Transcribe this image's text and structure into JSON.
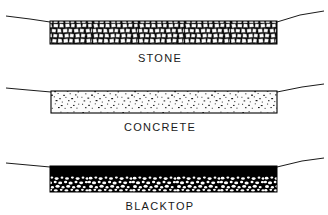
{
  "figure": {
    "background_color": "#ffffff",
    "ink_color": "#000000",
    "width": 328,
    "height": 215
  },
  "sections": [
    {
      "id": "stone",
      "label": "STONE",
      "fill_type": "crushed-stone-aggregate",
      "description": "Packed irregular light-toned crushed stones with dark mortar gaps",
      "band": {
        "x": 50,
        "y": 21,
        "width": 227,
        "height": 23
      },
      "label_position": {
        "x": 160,
        "y": 59
      },
      "ground_line": {
        "left": [
          [
            6,
            16
          ],
          [
            30,
            19
          ],
          [
            50,
            22
          ]
        ],
        "right": [
          [
            277,
            22
          ],
          [
            300,
            15
          ],
          [
            324,
            11
          ]
        ]
      },
      "colors": {
        "stone": "#ffffff",
        "mortar": "#111111",
        "outline": "#000000"
      }
    },
    {
      "id": "concrete",
      "label": "CONCRETE",
      "fill_type": "speckled-concrete",
      "description": "Light concrete slab with scattered fine dark aggregate speckles and thin black outline",
      "band": {
        "x": 51,
        "y": 91,
        "width": 226,
        "height": 22
      },
      "label_position": {
        "x": 160,
        "y": 128
      },
      "ground_line": {
        "left": [
          [
            6,
            88
          ],
          [
            28,
            90
          ],
          [
            51,
            92
          ]
        ],
        "right": [
          [
            277,
            92
          ],
          [
            302,
            87
          ],
          [
            324,
            84
          ]
        ]
      },
      "colors": {
        "slab": "#fbfbfb",
        "speckle": "#1a1a1a",
        "outline": "#000000"
      }
    },
    {
      "id": "blacktop",
      "label": "BLACKTOP",
      "fill_type": "asphalt-with-aggregate",
      "description": "Solid black asphalt upper layer over a base of light aggregate pebbles in black matrix",
      "band": {
        "x": 50,
        "y": 166,
        "width": 227,
        "height": 26
      },
      "asphalt_top_height": 10,
      "label_position": {
        "x": 160,
        "y": 207
      },
      "ground_line": {
        "left": [
          [
            6,
            163
          ],
          [
            28,
            165
          ],
          [
            50,
            167
          ]
        ],
        "right": [
          [
            277,
            167
          ],
          [
            302,
            161
          ],
          [
            324,
            158
          ]
        ]
      },
      "colors": {
        "asphalt": "#000000",
        "aggregate": "#ffffff",
        "outline": "#000000"
      }
    }
  ]
}
